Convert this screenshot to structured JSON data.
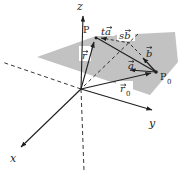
{
  "figure": {
    "type": "3d-plane-vector-diagram",
    "labels": {
      "axis_z": "z",
      "axis_x": "x",
      "axis_y": "y",
      "point_p": "P",
      "point_p0_base": "P",
      "point_p0_sub": "0",
      "vec_r": "r",
      "vec_r0_base": "r",
      "vec_r0_sub": "0",
      "vec_a": "a",
      "vec_b": "b",
      "vec_ta": "ta",
      "vec_sb": "sb"
    },
    "colors": {
      "ink": "#1f1f1f",
      "plane_fill": "#c2c2c2",
      "background": "#ffffff"
    }
  }
}
